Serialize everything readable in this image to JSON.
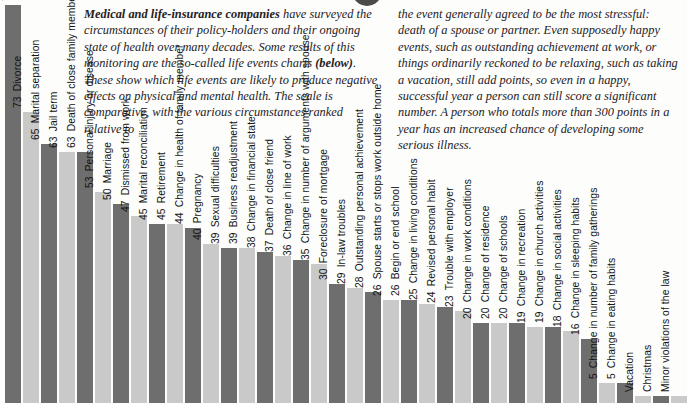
{
  "article": {
    "left_column": {
      "lead": "Medical and life-insurance companies",
      "body_1": " have surveyed the circumstances of their policy-holders and their ongoing state of health over many decades. Some results of this monitoring are the so-called life events charts ",
      "bold_2": "(below)",
      "body_2": ". These show which life events are likely to produce negative effects on physical and mental health. The scale is comparative, with the various circumstances ranked relative to"
    },
    "right_column": {
      "body": "the event generally agreed to be the most stressful: death of a spouse or partner. Even supposedly happy events, such as outstanding achievement at work, or things ordinarily reckoned to be relaxing, such as taking a vacation, still add points, so even in a happy, successful year a person can still score a significant number. A person who totals more than 300 points in a year has an increased chance of developing some serious illness."
    }
  },
  "chart_data": {
    "type": "bar",
    "title": "",
    "xlabel": "",
    "ylabel": "",
    "ylim": [
      0,
      100
    ],
    "grid": false,
    "legend": "none",
    "orientation": "vertical",
    "value_labels": "rotated, shown beside each bar top",
    "colors": {
      "bar_dark": "#6e6e6e",
      "bar_light": "#c9c9c9"
    },
    "categories": [
      "Death of spouse",
      "Divorce",
      "Marital separation",
      "Jail term",
      "Death of close family member",
      "Personal injury or disease",
      "Marriage",
      "Dismissed from work",
      "Marital reconciliation",
      "Retirement",
      "Change in health of family member",
      "Pregnancy",
      "Sexual difficulties",
      "Business readjustment",
      "Change in financial state",
      "Death of close friend",
      "Change in line of work",
      "Change in number of arguments with spouse",
      "Foreclosure of mortgage",
      "In-law troubles",
      "Outstanding personal achievement",
      "Spouse starts or stops work outside home",
      "Begin or end school",
      "Change in living conditions",
      "Revised personal habit",
      "Trouble with employer",
      "Change in work conditions",
      "Change of residence",
      "Change of schools",
      "Change in recreation",
      "Change in church activities",
      "Change in social activities",
      "Change in sleeping habits",
      "Change in number of family gatherings",
      "Change in eating habits",
      "Vacation",
      "Christmas",
      "Minor violations of the law"
    ],
    "values": [
      100,
      73,
      65,
      63,
      63,
      53,
      50,
      47,
      45,
      45,
      44,
      40,
      39,
      39,
      38,
      37,
      36,
      35,
      30,
      29,
      28,
      26,
      26,
      25,
      24,
      23,
      20,
      20,
      20,
      19,
      19,
      18,
      16,
      5,
      5,
      null,
      null,
      null
    ],
    "value_label_shown": [
      true,
      true,
      true,
      true,
      true,
      true,
      true,
      true,
      true,
      true,
      true,
      true,
      true,
      true,
      true,
      true,
      true,
      true,
      true,
      true,
      true,
      true,
      true,
      true,
      true,
      true,
      true,
      true,
      true,
      true,
      true,
      true,
      true,
      true,
      true,
      false,
      false,
      false
    ]
  }
}
